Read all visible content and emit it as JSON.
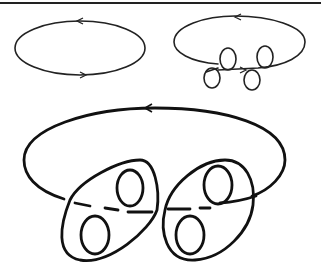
{
  "figure": {
    "panels": [
      {
        "name": "simple-oriented-ellipse",
        "arrows": [
          "left (top)",
          "right (bottom)"
        ]
      },
      {
        "name": "ellipse-with-four-loops",
        "loops": 4,
        "arrows": [
          "left (top)",
          "right (bottom center)"
        ]
      },
      {
        "name": "large-curve-with-two-bands",
        "bands": 2,
        "loops_per_band": 2,
        "arrows": [
          "left (top)"
        ]
      }
    ],
    "stroke_color": "#111111",
    "background": "#ffffff"
  }
}
